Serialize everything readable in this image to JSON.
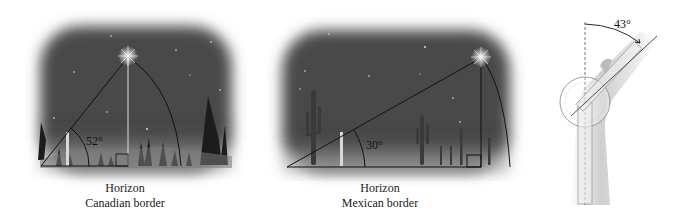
{
  "panels": [
    {
      "id": "canadian",
      "caption_line1": "Horizon",
      "caption_line2": "Canadian border",
      "angle_label": "52°",
      "angle_degrees": 52,
      "scenery": "pine trees at night",
      "star": "Polaris"
    },
    {
      "id": "mexican",
      "caption_line1": "Horizon",
      "caption_line2": "Mexican border",
      "angle_label": "30°",
      "angle_degrees": 30,
      "scenery": "saguaro cacti in desert at night",
      "star": "Polaris"
    },
    {
      "id": "goniometer",
      "angle_label": "43°",
      "angle_degrees": 43,
      "subject": "goniometer measuring bent arm"
    }
  ],
  "colors": {
    "sky_dark": "#3a3a3a",
    "sky_mid": "#6a6a6a",
    "horizon_glow": "#c8c8c8",
    "line": "#111111",
    "skin": "#d9d9d9"
  }
}
